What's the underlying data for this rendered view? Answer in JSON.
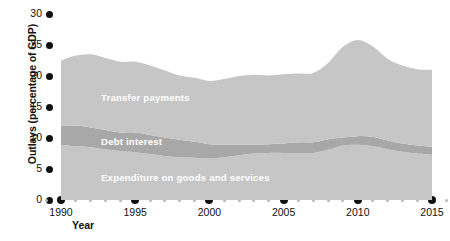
{
  "chart_data": {
    "type": "area",
    "stacked": true,
    "title": "",
    "subtitle": "",
    "xlabel": "Year",
    "ylabel": "Outlays (percentage of GDP)",
    "xlim": [
      1989,
      2016
    ],
    "ylim": [
      0,
      30
    ],
    "grid": false,
    "legend_position": "inline-annotations",
    "x_tick_labels": [
      "1990",
      "1995",
      "2000",
      "2005",
      "2010",
      "2015"
    ],
    "x_tick_values": [
      1990,
      1995,
      2000,
      2005,
      2010,
      2015
    ],
    "x_minor_ticks": [
      1989,
      1991,
      1992,
      1993,
      1994,
      1996,
      1997,
      1998,
      1999,
      2001,
      2002,
      2003,
      2004,
      2006,
      2007,
      2008,
      2009,
      2011,
      2012,
      2013,
      2014,
      2016
    ],
    "y_tick_labels": [
      "0",
      "5",
      "10",
      "15",
      "20",
      "25",
      "30"
    ],
    "y_tick_values": [
      0,
      5,
      10,
      15,
      20,
      25,
      30
    ],
    "x": [
      1990,
      1991,
      1992,
      1993,
      1994,
      1995,
      1996,
      1997,
      1998,
      1999,
      2000,
      2001,
      2002,
      2003,
      2004,
      2005,
      2006,
      2007,
      2008,
      2009,
      2010,
      2011,
      2012,
      2013,
      2014,
      2015
    ],
    "series": [
      {
        "name": "Expenditure on goods and services",
        "color": "#c6c6c6",
        "values": [
          8.8,
          8.7,
          8.5,
          8.2,
          7.9,
          7.7,
          7.4,
          7.1,
          6.9,
          6.8,
          6.7,
          6.9,
          7.2,
          7.5,
          7.6,
          7.6,
          7.6,
          7.6,
          8.1,
          8.8,
          8.9,
          8.7,
          8.2,
          7.8,
          7.5,
          7.3
        ]
      },
      {
        "name": "Debt interest",
        "color": "#a8a8a8",
        "values": [
          3.2,
          3.3,
          3.2,
          3.1,
          3.0,
          3.2,
          3.1,
          3.0,
          2.8,
          2.6,
          2.3,
          2.0,
          1.7,
          1.4,
          1.4,
          1.5,
          1.7,
          1.7,
          1.7,
          1.3,
          1.4,
          1.5,
          1.4,
          1.3,
          1.3,
          1.3
        ]
      },
      {
        "name": "Transfer payments",
        "color": "#c6c6c6",
        "values": [
          10.5,
          11.3,
          11.8,
          11.6,
          11.4,
          11.4,
          11.2,
          10.8,
          10.4,
          10.3,
          10.2,
          10.6,
          11.1,
          11.3,
          11.1,
          11.2,
          11.1,
          11.2,
          12.3,
          14.6,
          15.5,
          14.6,
          13.2,
          12.6,
          12.3,
          12.4
        ]
      }
    ],
    "totals": [
      22.5,
      23.3,
      23.5,
      22.9,
      22.3,
      22.3,
      21.7,
      20.9,
      20.1,
      19.7,
      19.2,
      19.5,
      20.0,
      20.2,
      20.1,
      20.3,
      20.4,
      20.5,
      22.1,
      24.7,
      25.8,
      24.8,
      22.8,
      21.7,
      21.1,
      21.0
    ]
  },
  "annotations": {
    "transfer_payments": "Transfer payments",
    "debt_interest": "Debt interest",
    "expenditure": "Expenditure on goods and services"
  },
  "axes": {
    "y_title": "Outlays (percentage of GDP)",
    "x_title": "Year"
  }
}
